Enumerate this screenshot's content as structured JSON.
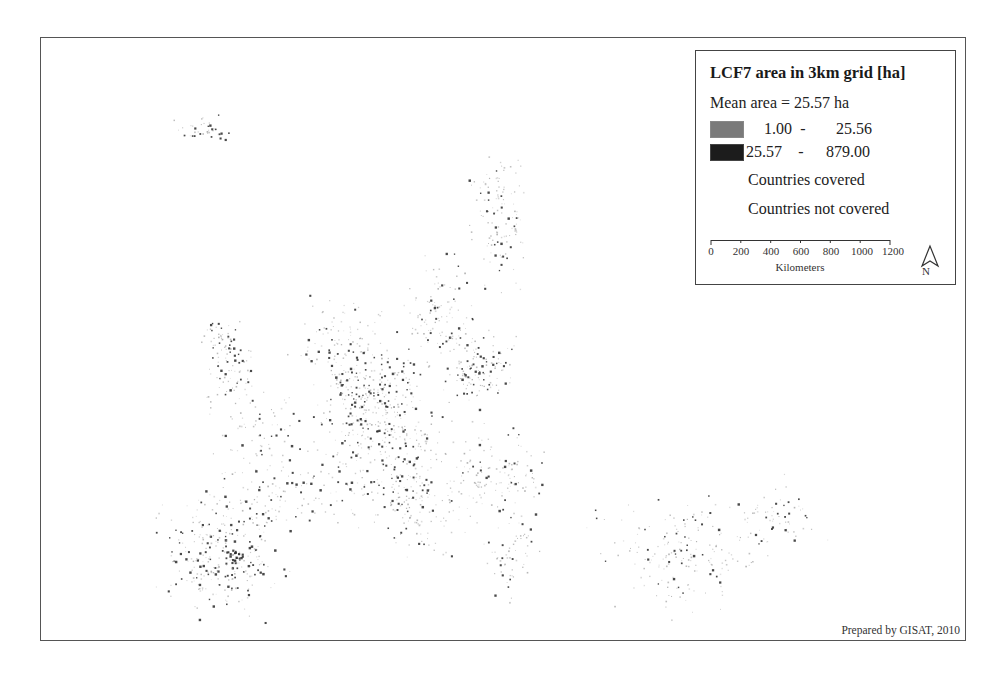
{
  "map": {
    "type": "thematic-dot-map",
    "region": "Europe",
    "background_color": "#ffffff",
    "point_colors": {
      "low": "#8a8a8a",
      "high": "#2a2a2a"
    }
  },
  "legend": {
    "title": "LCF7 area in 3km grid [ha]",
    "mean_label": "Mean area = 25.57 ha",
    "classes": [
      {
        "low": "1.00",
        "sep": "-",
        "high": "25.56",
        "color": "#7a7a7a"
      },
      {
        "low": "25.57",
        "sep": "-",
        "high": "879.00",
        "color": "#1c1c1c"
      }
    ],
    "countries_covered": "Countries covered",
    "countries_not_covered": "Countries not covered"
  },
  "scalebar": {
    "ticks": [
      "0",
      "200",
      "400",
      "600",
      "800",
      "1000",
      "1200"
    ],
    "unit": "Kilometers"
  },
  "north_arrow": {
    "label": "N"
  },
  "credit": "Prepared by GISAT, 2010"
}
